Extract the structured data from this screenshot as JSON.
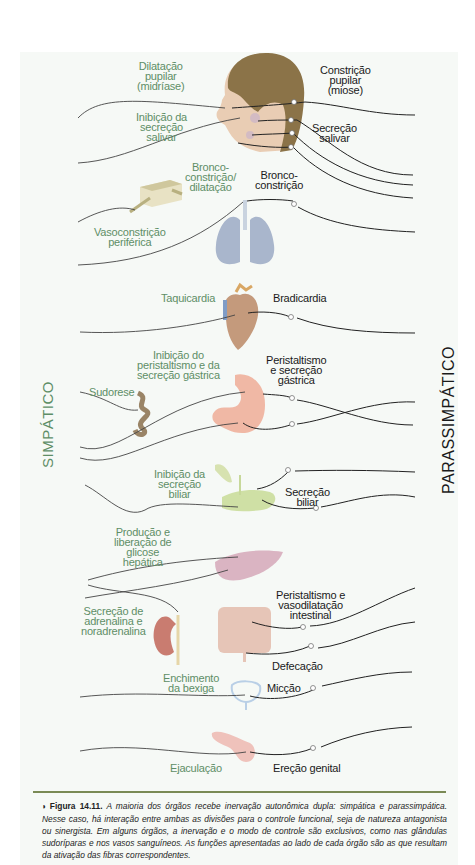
{
  "figure": {
    "side_labels": {
      "sympathetic": "SIMPÁTICO",
      "parasympathetic": "PARASSIMPÁTICO"
    },
    "colors": {
      "sympathetic_text": "#5e8e66",
      "parasympathetic_text": "#1a1a1a",
      "panel_background": "#f6f9f6",
      "divider": "#7a8a55",
      "nerve_line": "#2a2a2a"
    },
    "organs": [
      {
        "organ": "eye",
        "sympathetic": "Dilatação\npupilar\n(midríase)",
        "parasympathetic": "Constrição\npupilar\n(miose)"
      },
      {
        "organ": "salivary-glands",
        "sympathetic": "Inibição da\nsecreção\nsalivar",
        "parasympathetic": "Secreção\nsalivar"
      },
      {
        "organ": "blood-vessels",
        "sympathetic": "Vasoconstrição\nperiférica",
        "parasympathetic": ""
      },
      {
        "organ": "lungs",
        "sympathetic": "Bronco-\nconstrição/\ndilatação",
        "parasympathetic": "Bronco-\nconstrição"
      },
      {
        "organ": "heart",
        "sympathetic": "Taquicardia",
        "parasympathetic": "Bradicardia"
      },
      {
        "organ": "sweat-gland",
        "sympathetic": "Sudorese",
        "parasympathetic": ""
      },
      {
        "organ": "stomach",
        "sympathetic": "Inibição do\nperistaltismo e da\nsecreção gástrica",
        "parasympathetic": "Peristaltismo\ne secreção\ngástrica"
      },
      {
        "organ": "pancreas-gallbladder",
        "sympathetic": "Inibição da\nsecreção\nbiliar",
        "parasympathetic": "Secreção\nbiliar"
      },
      {
        "organ": "liver",
        "sympathetic": "Produção e\nliberação de\nglicose\nhepática",
        "parasympathetic": ""
      },
      {
        "organ": "adrenal-kidney",
        "sympathetic": "Secreção de\nadrenalina e\nnoradrenalina",
        "parasympathetic": ""
      },
      {
        "organ": "intestine",
        "sympathetic": "",
        "parasympathetic": "Peristaltismo e\nvasodilatação\nintestinal"
      },
      {
        "organ": "rectum",
        "sympathetic": "",
        "parasympathetic": "Defecação"
      },
      {
        "organ": "bladder",
        "sympathetic": "Enchimento\nda bexiga",
        "parasympathetic": "Micção"
      },
      {
        "organ": "genitals",
        "sympathetic": "Ejaculação",
        "parasympathetic": "Ereção genital"
      }
    ],
    "caption": {
      "marker": "◗",
      "figure_number": "Figura 14.11.",
      "text": "A maioria dos órgãos recebe inervação autonômica dupla: simpática e parassimpática. Nesse caso, há interação entre ambas as divisões para o controle funcional, seja de natureza antagonista ou sinergista. Em alguns órgãos, a inervação e o modo de controle são exclusivos, como nas glândulas sudoríparas e nos vasos sanguíneos. As funções apresentadas ao lado de cada órgão são as que resultam da ativação das fibras correspondentes."
    }
  }
}
